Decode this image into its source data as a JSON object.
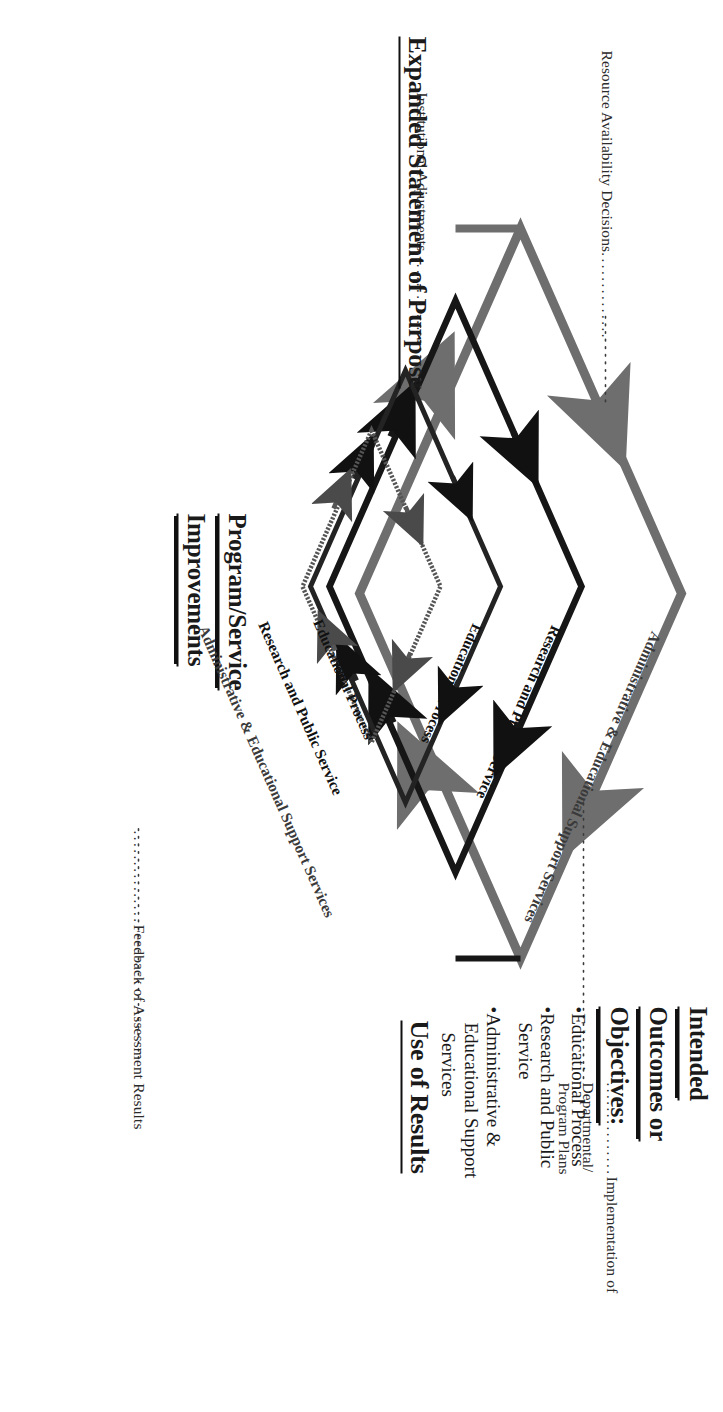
{
  "diagram": {
    "title_headings": {
      "expanded_statement": "Expanded Statement of Purpose",
      "use_of_results": "Use of Results",
      "intended_line1": "Intended",
      "intended_line2": "Outcomes or",
      "intended_line3": "Objectives:",
      "program_service_line1": "Program/Service",
      "program_service_line2": "Improvements"
    },
    "intended_bullets": [
      "•Educational Process",
      "•Research and Public Service",
      "•Administrative & Educational Support Services"
    ],
    "intended_bullets_flat": {
      "b1": "•Educational Process",
      "b2a": "•Research and Public",
      "b2b": "Service",
      "b3a": "•Administrative &",
      "b3b": "Educational Support",
      "b3c": "Services"
    },
    "leader_labels": {
      "resource": "Resource Availability Decisions",
      "resource_dots": "..............",
      "implementation_a": "Implementation of Departmental/",
      "implementation_b": "Program Plans",
      "implementation_dots": "...............",
      "institutional": "Institutional Adjustments",
      "institutional_dots": "...............",
      "feedback": "Feedback of Assessment Results",
      "feedback_dots": "..............."
    },
    "edge_labels": {
      "outer_top_right": "Administrative & Educational Support Services",
      "mid_top_right": "Research and Public Service",
      "inner_top_right": "Educational Process",
      "inner_bottom_right": "Educational Process",
      "mid_bottom_right": "Research and Public Service",
      "outer_bottom_right": "Administrative & Educational Support Services"
    },
    "colors": {
      "ink": "#111111",
      "grey_stroke": "#5a5a5a",
      "light_grey_stroke": "#8c8c8c",
      "paper": "#ffffff"
    }
  }
}
